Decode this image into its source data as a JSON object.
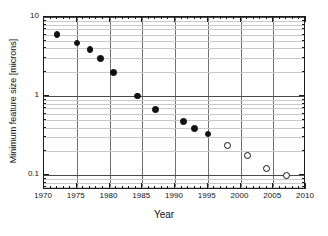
{
  "chart_data": {
    "type": "scatter",
    "title": "",
    "xlabel": "Year",
    "ylabel": "Minimum feature size [microns]",
    "xlim": [
      1970,
      2010
    ],
    "ylim": [
      0.065,
      10
    ],
    "yscale": "log",
    "xscale": "linear",
    "grid": true,
    "legend_position": "none",
    "xticks": [
      1970,
      1975,
      1980,
      1985,
      1990,
      1995,
      2000,
      2005,
      2010
    ],
    "xtick_labels": [
      "1970",
      "1975",
      "1980",
      "1985",
      "1990",
      "1995",
      "2000",
      "2005",
      "2010"
    ],
    "yticks": [
      0.1,
      1,
      10
    ],
    "ytick_labels": [
      "0.1",
      "1",
      "10"
    ],
    "series": [
      {
        "name": "historical",
        "marker": "filled-circle",
        "color": "#111111",
        "points": [
          {
            "x": 1972.0,
            "y": 6.0
          },
          {
            "x": 1975.0,
            "y": 4.7
          },
          {
            "x": 1977.0,
            "y": 3.9
          },
          {
            "x": 1978.6,
            "y": 3.0
          },
          {
            "x": 1980.6,
            "y": 2.0
          },
          {
            "x": 1984.3,
            "y": 1.0
          },
          {
            "x": 1987.0,
            "y": 0.68
          },
          {
            "x": 1991.3,
            "y": 0.48
          },
          {
            "x": 1993.0,
            "y": 0.39
          },
          {
            "x": 1995.0,
            "y": 0.33
          }
        ]
      },
      {
        "name": "projected",
        "marker": "open-circle",
        "color": "#111111",
        "points": [
          {
            "x": 1998.0,
            "y": 0.24
          },
          {
            "x": 2001.0,
            "y": 0.18
          },
          {
            "x": 2004.0,
            "y": 0.12
          },
          {
            "x": 2007.0,
            "y": 0.1
          }
        ]
      }
    ]
  }
}
